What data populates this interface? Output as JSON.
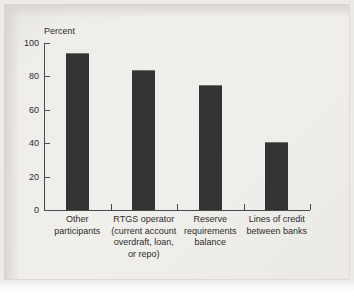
{
  "chart_data": {
    "type": "bar",
    "title": "",
    "subtitle": "",
    "xlabel": "",
    "ylabel": "Percent",
    "ylim": [
      0,
      100
    ],
    "yticks": [
      0,
      20,
      40,
      60,
      80,
      100
    ],
    "ytick_labels": [
      "0",
      "20",
      "40",
      "60",
      "80",
      "100"
    ],
    "grid": false,
    "legend": null,
    "bar_color": "#333333",
    "background_color": "#edebe8",
    "axis_color": "#4a4a4a",
    "categories": [
      "Other\nparticipants",
      "RTGS operator\n(current account\noverdraft, loan,\nor repo)",
      "Reserve\nrequirements\nbalance",
      "Lines of credit\nbetween banks"
    ],
    "values": [
      94,
      84,
      75,
      41
    ],
    "annotations": []
  },
  "figure": {
    "axis_title": "Percent"
  }
}
